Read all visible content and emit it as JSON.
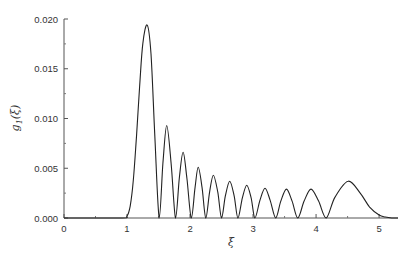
{
  "chart_data": {
    "type": "line",
    "title": "",
    "xlabel": "ξ",
    "ylabel": "g1(ξ)",
    "ylabel_main": "g",
    "ylabel_sub": "1",
    "ylabel_arg": "(ξ)",
    "xlim": [
      0,
      5.3
    ],
    "ylim": [
      0,
      0.02
    ],
    "xticks": [
      0,
      1,
      2,
      3,
      4,
      5
    ],
    "xtick_labels": [
      "0",
      "1",
      "2",
      "3",
      "4",
      "5"
    ],
    "yticks": [
      0.0,
      0.005,
      0.01,
      0.015,
      0.02
    ],
    "ytick_labels": [
      "0.000",
      "0.005",
      "0.010",
      "0.015",
      "0.020"
    ],
    "grid": false,
    "legend": null,
    "series": [
      {
        "name": "g1(ξ)",
        "color": "#222222",
        "x": [
          0,
          0.9,
          1.0,
          1.05,
          1.1,
          1.15,
          1.2,
          1.25,
          1.32,
          1.38,
          1.44,
          1.51,
          1.57,
          1.63,
          1.7,
          1.77,
          1.83,
          1.89,
          1.95,
          2.02,
          2.08,
          2.13,
          2.19,
          2.25,
          2.31,
          2.37,
          2.44,
          2.5,
          2.56,
          2.63,
          2.7,
          2.76,
          2.83,
          2.9,
          2.97,
          3.03,
          3.11,
          3.19,
          3.27,
          3.36,
          3.44,
          3.53,
          3.62,
          3.71,
          3.81,
          3.92,
          4.04,
          4.16,
          4.3,
          4.51,
          4.7,
          4.85,
          5.0,
          5.1,
          5.2,
          5.3
        ],
        "y": [
          0,
          0,
          0.0002,
          0.0012,
          0.0038,
          0.0082,
          0.0132,
          0.0175,
          0.0194,
          0.0165,
          0.0085,
          0,
          0.0055,
          0.0093,
          0.0055,
          0,
          0.004,
          0.0066,
          0.004,
          0,
          0.0031,
          0.0051,
          0.0031,
          0,
          0.0026,
          0.0043,
          0.0026,
          0,
          0.0022,
          0.0037,
          0.0022,
          0,
          0.002,
          0.0033,
          0.002,
          0,
          0.0018,
          0.003,
          0.0018,
          0,
          0.0017,
          0.0029,
          0.0017,
          0,
          0.0017,
          0.0029,
          0.0017,
          0,
          0.0021,
          0.0037,
          0.0025,
          0.0011,
          0.0003,
          0.0001,
          0,
          0
        ]
      }
    ],
    "peaks": [
      {
        "x": 1.32,
        "y": 0.0194
      },
      {
        "x": 1.63,
        "y": 0.0093
      },
      {
        "x": 1.89,
        "y": 0.0066
      },
      {
        "x": 2.13,
        "y": 0.0051
      },
      {
        "x": 2.37,
        "y": 0.0043
      },
      {
        "x": 2.63,
        "y": 0.0037
      },
      {
        "x": 2.9,
        "y": 0.0033
      },
      {
        "x": 3.19,
        "y": 0.003
      },
      {
        "x": 3.53,
        "y": 0.0029
      },
      {
        "x": 3.92,
        "y": 0.0029
      },
      {
        "x": 4.51,
        "y": 0.0037
      }
    ],
    "zeros": [
      1.51,
      1.77,
      2.02,
      2.25,
      2.5,
      2.76,
      3.03,
      3.36,
      3.71,
      4.16
    ]
  }
}
